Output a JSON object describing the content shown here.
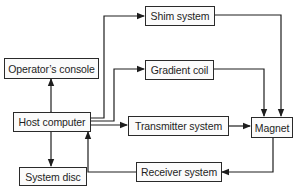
{
  "diagram": {
    "type": "block-diagram",
    "nodes": {
      "shim": {
        "label": "Shim system"
      },
      "console": {
        "label": "Operator’s console"
      },
      "gradient": {
        "label": "Gradient coil"
      },
      "host": {
        "label": "Host computer"
      },
      "transmitter": {
        "label": "Transmitter system"
      },
      "magnet": {
        "label": "Magnet"
      },
      "disc": {
        "label": "System disc"
      },
      "receiver": {
        "label": "Receiver system"
      }
    },
    "edges": [
      {
        "from": "host",
        "to": "shim"
      },
      {
        "from": "host",
        "to": "gradient"
      },
      {
        "from": "host",
        "to": "transmitter"
      },
      {
        "from": "shim",
        "to": "magnet"
      },
      {
        "from": "gradient",
        "to": "magnet"
      },
      {
        "from": "transmitter",
        "to": "magnet"
      },
      {
        "from": "magnet",
        "to": "receiver"
      },
      {
        "from": "receiver",
        "to": "host"
      },
      {
        "from": "host",
        "to": "console",
        "bidirectional": true
      },
      {
        "from": "host",
        "to": "disc",
        "bidirectional": true
      }
    ],
    "colors": {
      "line": "#1e1e1e",
      "box_border": "#2a2a2a",
      "box_fill": "#fbfbfb",
      "background": "#ffffff"
    }
  }
}
